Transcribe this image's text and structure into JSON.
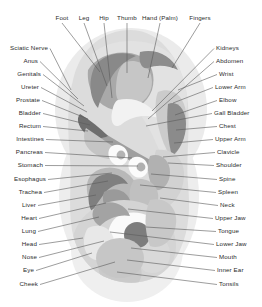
{
  "diagram": {
    "palette": {
      "background": "#ffffff",
      "leader_line": "#5a5a5a",
      "label_text": "#2b2b2b",
      "halo": "#ebebeb",
      "ear_base": "#d7d7d7",
      "light": "#e4e4e4",
      "mid_light": "#cfcfcf",
      "mid": "#bcbcbc",
      "mid_dark": "#a6a6a6",
      "dark": "#8f8f8f",
      "darkest": "#6f6f6f",
      "white": "#fcfcfc"
    }
  },
  "labels": {
    "top": [
      {
        "id": "foot",
        "text": "Foot",
        "lx": 62,
        "ly": 18,
        "tx": 100,
        "ty": 72
      },
      {
        "id": "leg",
        "text": "Leg",
        "lx": 84,
        "ly": 18,
        "tx": 107,
        "ty": 86
      },
      {
        "id": "hip",
        "text": "Hip",
        "lx": 104,
        "ly": 18,
        "tx": 112,
        "ty": 98
      },
      {
        "id": "thumb",
        "text": "Thumb",
        "lx": 127,
        "ly": 18,
        "tx": 127,
        "ty": 73
      },
      {
        "id": "hand-palm",
        "text": "Hand (Palm)",
        "lx": 160,
        "ly": 18,
        "tx": 148,
        "ty": 78
      },
      {
        "id": "fingers",
        "text": "Fingers",
        "lx": 200,
        "ly": 18,
        "tx": 172,
        "ty": 68
      }
    ],
    "left": [
      {
        "id": "sciatic-nerve",
        "text": "Sciatic Nerve",
        "lx": 48,
        "ly": 48,
        "tx": 71,
        "ty": 90
      },
      {
        "id": "anus",
        "text": "Anus",
        "lx": 38,
        "ly": 61,
        "tx": 78,
        "ty": 99
      },
      {
        "id": "genitals",
        "text": "Genitals",
        "lx": 41,
        "ly": 74,
        "tx": 84,
        "ty": 106
      },
      {
        "id": "ureter",
        "text": "Ureter",
        "lx": 39,
        "ly": 87,
        "tx": 87,
        "ty": 112
      },
      {
        "id": "prostate",
        "text": "Prostate",
        "lx": 40,
        "ly": 100,
        "tx": 88,
        "ty": 119
      },
      {
        "id": "bladder",
        "text": "Bladder",
        "lx": 41,
        "ly": 113,
        "tx": 90,
        "ty": 125
      },
      {
        "id": "rectum",
        "text": "Rectum",
        "lx": 41,
        "ly": 126,
        "tx": 88,
        "ty": 131
      },
      {
        "id": "intestines",
        "text": "Intestines",
        "lx": 44,
        "ly": 139,
        "tx": 113,
        "ty": 142
      },
      {
        "id": "pancreas",
        "text": "Pancreas",
        "lx": 43,
        "ly": 152,
        "tx": 132,
        "ty": 158
      },
      {
        "id": "stomach",
        "text": "Stomach",
        "lx": 43,
        "ly": 165,
        "tx": 138,
        "ty": 166
      },
      {
        "id": "esophagus",
        "text": "Esophagus",
        "lx": 46,
        "ly": 179,
        "tx": 112,
        "ty": 173
      },
      {
        "id": "trachea",
        "text": "Trachea",
        "lx": 42,
        "ly": 192,
        "tx": 108,
        "ty": 181
      },
      {
        "id": "liver",
        "text": "Liver",
        "lx": 36,
        "ly": 205,
        "tx": 96,
        "ty": 195
      },
      {
        "id": "heart",
        "text": "Heart",
        "lx": 37,
        "ly": 218,
        "tx": 106,
        "ty": 203
      },
      {
        "id": "lung",
        "text": "Lung",
        "lx": 36,
        "ly": 231,
        "tx": 99,
        "ty": 217
      },
      {
        "id": "head",
        "text": "Head",
        "lx": 37,
        "ly": 244,
        "tx": 83,
        "ty": 238
      },
      {
        "id": "nose",
        "text": "Nose",
        "lx": 37,
        "ly": 257,
        "tx": 104,
        "ty": 241
      },
      {
        "id": "eye",
        "text": "Eye",
        "lx": 34,
        "ly": 270,
        "tx": 92,
        "ty": 253
      },
      {
        "id": "cheek",
        "text": "Cheek",
        "lx": 38,
        "ly": 284,
        "tx": 115,
        "ty": 262
      }
    ],
    "right": [
      {
        "id": "kidneys",
        "text": "Kidneys",
        "lx": 216,
        "ly": 48,
        "tx": 152,
        "ty": 111
      },
      {
        "id": "abdomen",
        "text": "Abdomen",
        "lx": 216,
        "ly": 61,
        "tx": 148,
        "ty": 119
      },
      {
        "id": "wrist",
        "text": "Wrist",
        "lx": 219,
        "ly": 74,
        "tx": 178,
        "ty": 90
      },
      {
        "id": "lower-arm",
        "text": "Lower Arm",
        "lx": 215,
        "ly": 87,
        "tx": 173,
        "ty": 103
      },
      {
        "id": "elbow",
        "text": "Elbow",
        "lx": 219,
        "ly": 100,
        "tx": 175,
        "ty": 115
      },
      {
        "id": "gall-bladder",
        "text": "Gall Bladder",
        "lx": 214,
        "ly": 113,
        "tx": 146,
        "ty": 126
      },
      {
        "id": "chest",
        "text": "Chest",
        "lx": 219,
        "ly": 126,
        "tx": 176,
        "ty": 130
      },
      {
        "id": "upper-arm",
        "text": "Upper Arm",
        "lx": 215,
        "ly": 139,
        "tx": 174,
        "ty": 143
      },
      {
        "id": "clavicle",
        "text": "Clavicle",
        "lx": 217,
        "ly": 152,
        "tx": 163,
        "ty": 157
      },
      {
        "id": "shoulder",
        "text": "Shoulder",
        "lx": 216,
        "ly": 165,
        "tx": 168,
        "ty": 163
      },
      {
        "id": "spine",
        "text": "Spine",
        "lx": 219,
        "ly": 179,
        "tx": 151,
        "ty": 174
      },
      {
        "id": "spleen",
        "text": "Spleen",
        "lx": 218,
        "ly": 192,
        "tx": 140,
        "ty": 185
      },
      {
        "id": "neck",
        "text": "Neck",
        "lx": 220,
        "ly": 205,
        "tx": 160,
        "ty": 198
      },
      {
        "id": "upper-jaw",
        "text": "Upper Jaw",
        "lx": 215,
        "ly": 218,
        "tx": 128,
        "ty": 209
      },
      {
        "id": "tongue",
        "text": "Tongue",
        "lx": 218,
        "ly": 231,
        "tx": 146,
        "ty": 227
      },
      {
        "id": "lower-jaw",
        "text": "Lower Jaw",
        "lx": 216,
        "ly": 244,
        "tx": 110,
        "ty": 232
      },
      {
        "id": "mouth",
        "text": "Mouth",
        "lx": 219,
        "ly": 257,
        "tx": 131,
        "ty": 248
      },
      {
        "id": "inner-ear",
        "text": "Inner Ear",
        "lx": 217,
        "ly": 270,
        "tx": 127,
        "ty": 260
      },
      {
        "id": "tonsils",
        "text": "Tonsils",
        "lx": 219,
        "ly": 284,
        "tx": 117,
        "ty": 272
      }
    ]
  }
}
